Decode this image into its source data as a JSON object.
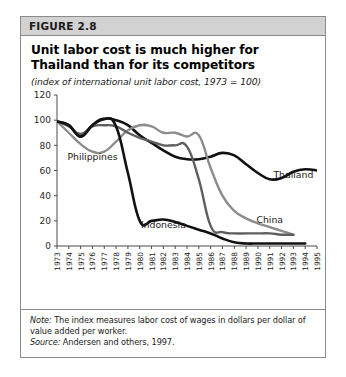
{
  "figure": {
    "header_label": "FIGURE 2.8",
    "title": "Unit labor cost is much higher for Thailand than for its competitors",
    "subtitle": "(index of international unit labor cost, 1973 = 100)"
  },
  "note": {
    "note_lead": "Note:",
    "note_text": " The index measures labor cost of wages in dollars per dollar of value added per worker.",
    "source_lead": "Source:",
    "source_text": " Andersen and others, 1997."
  },
  "chart_data": {
    "type": "line",
    "title": "Unit labor cost is much higher for Thailand than for its competitors",
    "subtitle": "(index of international unit labor cost, 1973 = 100)",
    "xlabel": "",
    "ylabel": "",
    "ylim": [
      0,
      120
    ],
    "yticks": [
      0,
      20,
      40,
      60,
      80,
      100,
      120
    ],
    "grid": false,
    "legend": "inline-labels",
    "x": [
      1973,
      1974,
      1975,
      1976,
      1977,
      1978,
      1979,
      1980,
      1981,
      1982,
      1983,
      1984,
      1985,
      1986,
      1987,
      1988,
      1989,
      1990,
      1991,
      1992,
      1993,
      1994,
      1995
    ],
    "xticks": [
      "1973",
      "1974",
      "1975",
      "1976",
      "1977",
      "1978",
      "1979",
      "1980",
      "1981",
      "1982",
      "1983",
      "1984",
      "1985",
      "1986",
      "1987",
      "1988",
      "1989",
      "1990",
      "1991",
      "1992",
      "1993",
      "1994",
      "1995"
    ],
    "series": [
      {
        "name": "Thailand",
        "color": "#111111",
        "width": 2.6,
        "label_x": 1993,
        "label_y": 54,
        "x": [
          1973,
          1974,
          1975,
          1976,
          1977,
          1978,
          1979,
          1980,
          1981,
          1982,
          1983,
          1984,
          1985,
          1986,
          1987,
          1988,
          1989,
          1990,
          1991,
          1992,
          1993,
          1994,
          1995
        ],
        "values": [
          99,
          96,
          87,
          96,
          101,
          100,
          96,
          88,
          82,
          76,
          71,
          69,
          69,
          71,
          74,
          72,
          65,
          58,
          53,
          54,
          59,
          61,
          60
        ]
      },
      {
        "name": "Philippines",
        "color": "#8c8c8c",
        "width": 2.4,
        "label_x": 1976,
        "label_y": 68,
        "x": [
          1973,
          1974,
          1975,
          1976,
          1977,
          1978,
          1979,
          1980,
          1981,
          1982,
          1983,
          1984,
          1985,
          1986,
          1987,
          1988,
          1989,
          1990,
          1991,
          1992,
          1993
        ],
        "values": [
          99,
          90,
          81,
          75,
          75,
          83,
          92,
          96,
          95,
          90,
          90,
          87,
          88,
          62,
          40,
          28,
          22,
          18,
          15,
          12,
          9
        ]
      },
      {
        "name": "China",
        "color": "#5f5f5f",
        "width": 2.4,
        "label_x": 1991,
        "label_y": 18,
        "x": [
          1973,
          1974,
          1975,
          1976,
          1977,
          1978,
          1979,
          1980,
          1981,
          1982,
          1983,
          1984,
          1985,
          1986,
          1987,
          1988,
          1989,
          1990,
          1991,
          1992,
          1993
        ],
        "values": [
          99,
          95,
          89,
          95,
          96,
          95,
          90,
          86,
          83,
          80,
          80,
          79,
          53,
          16,
          11,
          10,
          10,
          10,
          10,
          9,
          9
        ]
      },
      {
        "name": "Indonesia",
        "color": "#111111",
        "width": 2.6,
        "label_x": 1982,
        "label_y": 14,
        "x": [
          1973,
          1974,
          1975,
          1976,
          1977,
          1978,
          1979,
          1980,
          1981,
          1982,
          1983,
          1984,
          1985,
          1986,
          1987,
          1988,
          1989,
          1990,
          1991,
          1992,
          1993,
          1994
        ],
        "values": [
          99,
          96,
          87,
          96,
          101,
          95,
          58,
          20,
          20,
          21,
          19,
          16,
          13,
          10,
          6,
          3,
          2,
          2,
          2,
          2,
          2,
          2
        ]
      }
    ],
    "annotations": [
      {
        "text": "Philippines",
        "series": "Philippines"
      },
      {
        "text": "Thailand",
        "series": "Thailand"
      },
      {
        "text": "China",
        "series": "China"
      },
      {
        "text": "Indonesia",
        "series": "Indonesia"
      }
    ]
  }
}
